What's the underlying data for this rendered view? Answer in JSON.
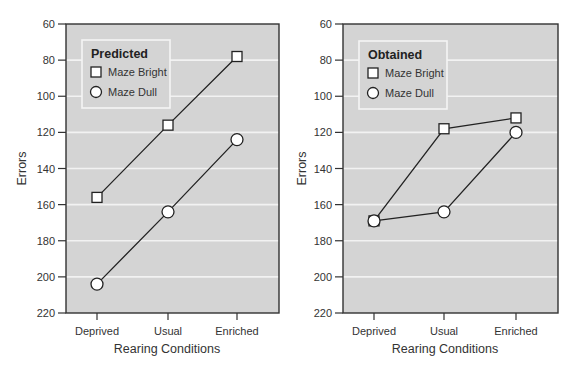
{
  "chart_data": [
    {
      "type": "line",
      "title": "Predicted",
      "xlabel": "Rearing Conditions",
      "ylabel": "Errors",
      "categories": [
        "Deprived",
        "Usual",
        "Enriched"
      ],
      "yticks": [
        60,
        80,
        100,
        120,
        140,
        160,
        180,
        200,
        220
      ],
      "ylim": [
        60,
        220
      ],
      "y_inverted": true,
      "grid": true,
      "legend_position": "top-left",
      "series": [
        {
          "name": "Maze Bright",
          "marker": "square",
          "values": [
            156,
            116,
            78
          ]
        },
        {
          "name": "Maze Dull",
          "marker": "circle",
          "values": [
            204,
            164,
            124
          ]
        }
      ]
    },
    {
      "type": "line",
      "title": "Obtained",
      "xlabel": "Rearing Conditions",
      "ylabel": "Errors",
      "categories": [
        "Deprived",
        "Usual",
        "Enriched"
      ],
      "yticks": [
        60,
        80,
        100,
        120,
        140,
        160,
        180,
        200,
        220
      ],
      "ylim": [
        60,
        220
      ],
      "y_inverted": true,
      "grid": true,
      "legend_position": "top-left",
      "series": [
        {
          "name": "Maze Bright",
          "marker": "square",
          "values": [
            169,
            118,
            112
          ]
        },
        {
          "name": "Maze Dull",
          "marker": "circle",
          "values": [
            169,
            164,
            120
          ]
        }
      ]
    }
  ],
  "colors": {
    "plot_background": "#d4d4d4",
    "gridline": "#f2f2f2",
    "line": "#222222",
    "marker_fill": "#ffffff"
  }
}
